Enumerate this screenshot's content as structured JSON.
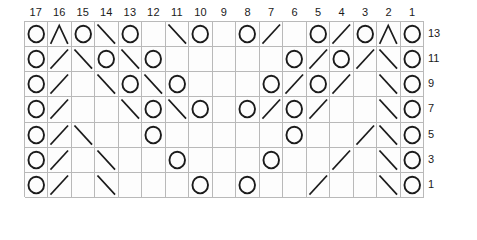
{
  "chart_data": {
    "type": "table",
    "xlabel": "Stitch number",
    "ylabel": "Row number",
    "grid": true,
    "columns": 17,
    "rows": 7,
    "column_headers": [
      "17",
      "16",
      "15",
      "14",
      "13",
      "12",
      "11",
      "10",
      "9",
      "8",
      "7",
      "6",
      "5",
      "4",
      "3",
      "2",
      "1"
    ],
    "row_labels": [
      "13",
      "11",
      "9",
      "7",
      "5",
      "3",
      "1"
    ],
    "legend": [
      {
        "symbol": "O",
        "name": "yarn-over"
      },
      {
        "symbol": "/",
        "name": "ssk-left-leaning-decrease"
      },
      {
        "symbol": "\\",
        "name": "k2tog-right-leaning-decrease"
      },
      {
        "symbol": "^",
        "name": "central-double-decrease"
      },
      {
        "symbol": "",
        "name": "knit-blank"
      }
    ],
    "symbol_map": {
      "O": "circle",
      "/": "slash",
      "\\": "backslash",
      "^": "peak",
      "": "blank"
    },
    "cells": [
      [
        "O",
        "^",
        "O",
        "\\",
        "O",
        "",
        "\\",
        "O",
        "",
        "O",
        "/",
        "",
        "O",
        "/",
        "O",
        "^",
        "O"
      ],
      [
        "O",
        "/",
        "\\",
        "O",
        "\\",
        "O",
        "",
        "",
        "",
        "",
        "",
        "O",
        "/",
        "O",
        "/",
        "\\",
        "O"
      ],
      [
        "O",
        "/",
        "",
        "\\",
        "O",
        "\\",
        "O",
        "",
        "",
        "",
        "O",
        "/",
        "O",
        "/",
        "",
        "\\",
        "O"
      ],
      [
        "O",
        "/",
        "",
        "",
        "\\",
        "O",
        "\\",
        "O",
        "",
        "O",
        "/",
        "O",
        "/",
        "",
        "",
        "\\",
        "O"
      ],
      [
        "O",
        "/",
        "\\",
        "",
        "",
        "O",
        "",
        "",
        "",
        "",
        "",
        "O",
        "",
        "",
        "/",
        "\\",
        "O"
      ],
      [
        "O",
        "/",
        "",
        "\\",
        "",
        "",
        "O",
        "",
        "",
        "",
        "O",
        "",
        "",
        "/",
        "",
        "\\",
        "O"
      ],
      [
        "O",
        "/",
        "",
        "\\",
        "",
        "",
        "",
        "O",
        "",
        "O",
        "",
        "",
        "/",
        "",
        "",
        "\\",
        "O"
      ]
    ]
  }
}
